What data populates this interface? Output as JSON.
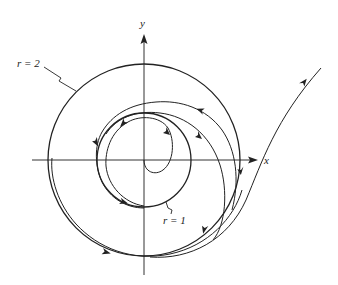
{
  "figure": {
    "type": "phase-portrait",
    "axes": {
      "x_label": "x",
      "y_label": "y"
    },
    "annotations": {
      "outer_circle_label": "r = 2",
      "inner_circle_label": "r = 1"
    },
    "circles": [
      {
        "name": "outer",
        "r": 2
      },
      {
        "name": "inner",
        "r": 1
      }
    ],
    "colors": {
      "stroke": "#222222",
      "background": "#ffffff"
    }
  }
}
